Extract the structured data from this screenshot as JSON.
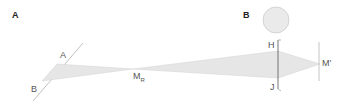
{
  "panels": [
    {
      "label": "A"
    },
    {
      "label": "B"
    }
  ],
  "points": {
    "A": "A",
    "B": "B",
    "M": "M",
    "M_sub": "R",
    "H": "H",
    "J": "J",
    "M_prime": "M'"
  },
  "colors": {
    "beam_fill": "#e6e6e6",
    "beam_stroke": "#cfcfcf",
    "line": "#aaaaaa",
    "dark_line": "#555555",
    "circle_fill": "#eaeaea",
    "circle_stroke": "#cccccc",
    "text": "#555555"
  }
}
